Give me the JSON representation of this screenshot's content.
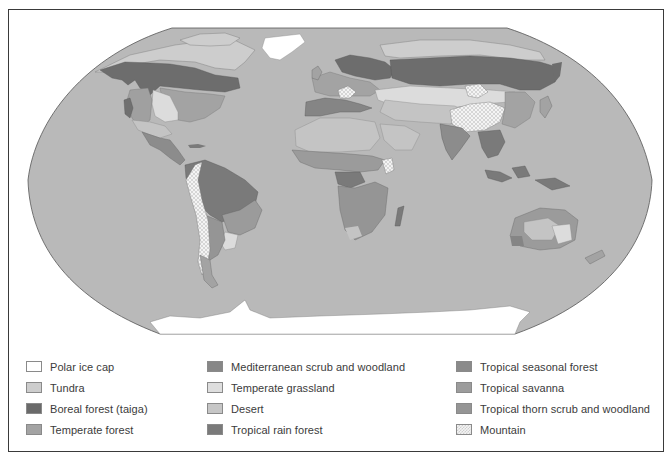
{
  "map": {
    "title": "World biomes",
    "projection": "Robinson-style world map",
    "colors": {
      "ocean": "#b9b9b9",
      "polar_ice_cap": "#ffffff",
      "tundra": "#cdcdcd",
      "boreal_forest": "#6d6d6d",
      "temperate_forest": "#a3a3a3",
      "mediterranean_scrub": "#858585",
      "temperate_grassland": "#dcdcdc",
      "desert": "#c4c4c4",
      "tropical_rain_forest": "#7a7a7a",
      "tropical_seasonal_forest": "#8c8c8c",
      "tropical_savanna": "#9b9b9b",
      "tropical_thorn_scrub": "#959595",
      "mountain": "#ededed"
    }
  },
  "legend": {
    "columns": [
      {
        "items": [
          {
            "label": "Polar ice cap",
            "color": "#ffffff"
          },
          {
            "label": "Tundra",
            "color": "#cdcdcd"
          },
          {
            "label": "Boreal forest (taiga)",
            "color": "#6a6a6a"
          },
          {
            "label": "Temperate forest",
            "color": "#a3a3a3"
          }
        ]
      },
      {
        "items": [
          {
            "label": "Mediterranean scrub and woodland",
            "color": "#878787"
          },
          {
            "label": "Temperate grassland",
            "color": "#dedede"
          },
          {
            "label": "Desert",
            "color": "#c6c6c6"
          },
          {
            "label": "Tropical rain forest",
            "color": "#7a7a7a"
          }
        ]
      },
      {
        "items": [
          {
            "label": "Tropical seasonal forest",
            "color": "#8a8a8a"
          },
          {
            "label": "Tropical savanna",
            "color": "#9c9c9c"
          },
          {
            "label": "Tropical thorn scrub and woodland",
            "color": "#959595"
          },
          {
            "label": "Mountain",
            "color": "pattern"
          }
        ]
      }
    ]
  }
}
